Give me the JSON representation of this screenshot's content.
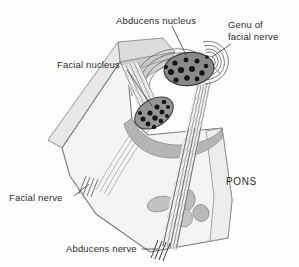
{
  "figure": {
    "background_color": "#fefefe"
  },
  "labels": {
    "abducens_nucleus": "Abducens nucleus",
    "genu_line1": "Genu of",
    "genu_line2": "facial nerve",
    "facial_nucleus": "Facial nucleus",
    "facial_nerve": "Facial nerve",
    "abducens_nerve": "Abducens nerve",
    "pons": "PONS"
  },
  "colors": {
    "outline": "#6f6f6f",
    "cut_surface": "#e9e9e9",
    "cut_surface_dark": "#cfcfcf",
    "pons_body": "#f2f2f2",
    "tegmentum_band": "#b9b9b9",
    "nucleus_fill": "#8d8d8d",
    "nucleus_fill_dark": "#7a7a7a",
    "neuron_dot": "#1c1c1c",
    "fiber": "#707070",
    "fiber_light": "#b0b0b0",
    "pontine_blob": "#bdbdbd",
    "label_text": "#2b2b2b",
    "leader_line": "#3a3a3a"
  },
  "structures": [
    {
      "name": "abducens-nucleus",
      "shape": "oval",
      "cx": 189,
      "cy": 69,
      "rx": 24,
      "ry": 16,
      "neuron_count": 13
    },
    {
      "name": "facial-nucleus",
      "shape": "oval",
      "cx": 154,
      "cy": 113,
      "rx": 20,
      "ry": 13,
      "rotation": -30,
      "neuron_count": 12
    },
    {
      "name": "genu-of-facial-nerve",
      "shape": "concentric-arcs",
      "cx": 205,
      "cy": 55,
      "arc_count": 5
    },
    {
      "name": "facial-nerve-tract",
      "shape": "fiber-bundle",
      "from": "facial-nucleus",
      "to": "ventral-surface"
    },
    {
      "name": "abducens-nerve-tract",
      "shape": "fiber-bundle",
      "from": "abducens-nucleus",
      "to": "ventral-surface"
    },
    {
      "name": "pontine-nuclei",
      "shape": "blob-cluster",
      "count": 4
    }
  ]
}
